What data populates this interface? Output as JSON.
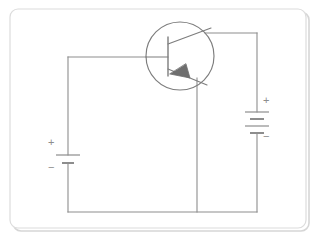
{
  "figure": {
    "kind": "electronic-circuit-schematic",
    "background_color": "#ffffff",
    "border": {
      "name": "figure-frame",
      "color": "#d8d8d8",
      "shadow_color": "#cfcfcf",
      "corner_radius": 8,
      "x": 10,
      "y": 9,
      "width": 296,
      "height": 219
    },
    "line_color": "#8d8d8d",
    "line_width": 1.1,
    "label_color": "#8d8d8d"
  },
  "components": {
    "transistor": {
      "name": "pnp-transistor",
      "type": "PNP bipolar junction transistor",
      "envelope_circle": {
        "cx": 180,
        "cy": 56,
        "r": 34
      },
      "base_bar": {
        "x": 168,
        "y1": 37,
        "y2": 76
      },
      "base_lead": {
        "x1": 146,
        "y1": 57,
        "x2": 168,
        "y2": 57
      },
      "collector_lead": {
        "x1": 168,
        "y1": 43,
        "x2": 213,
        "y2": 26
      },
      "emitter_lead": {
        "x1": 168,
        "y1": 70,
        "x2": 206,
        "y2": 86
      },
      "arrow_on": "emitter",
      "arrow_direction": "toward-base"
    },
    "battery_left": {
      "name": "battery-left",
      "cells": 1,
      "orientation": "vertical",
      "x": 68,
      "plus_plate_y": 155,
      "minus_plate_y": 163,
      "plus_label": "+",
      "minus_label": "−",
      "plus_label_pos": {
        "x": 49,
        "y": 142
      },
      "minus_label_pos": {
        "x": 49,
        "y": 166
      }
    },
    "battery_right": {
      "name": "battery-right",
      "cells": 2,
      "orientation": "vertical",
      "x": 257,
      "plate_ys": [
        112,
        119,
        126,
        133
      ],
      "plus_label": "+",
      "minus_label": "−",
      "plus_label_pos": {
        "x": 264,
        "y": 99
      },
      "minus_label_pos": {
        "x": 264,
        "y": 135
      }
    }
  },
  "wires": {
    "base_branch_top": {
      "name": "wire-base-top",
      "x1": 68,
      "y1": 57,
      "x2": 146,
      "y2": 57
    },
    "left_vertical_upper": {
      "name": "wire-left-upper",
      "x1": 68,
      "y1": 57,
      "x2": 68,
      "y2": 155
    },
    "left_vertical_lower": {
      "name": "wire-left-lower",
      "x1": 68,
      "y1": 163,
      "x2": 68,
      "y2": 212
    },
    "bottom_horizontal": {
      "name": "wire-bottom",
      "x1": 68,
      "y1": 212,
      "x2": 257,
      "y2": 212
    },
    "emitter_vertical": {
      "name": "wire-emitter-down",
      "x1": 197,
      "y1": 78,
      "x2": 197,
      "y2": 212
    },
    "collector_top": {
      "name": "wire-collector-top",
      "x1": 206,
      "y1": 33,
      "x2": 257,
      "y2": 33
    },
    "right_vertical_upper": {
      "name": "wire-right-upper",
      "x1": 257,
      "y1": 33,
      "x2": 257,
      "y2": 112
    },
    "right_vertical_lower": {
      "name": "wire-right-lower",
      "x1": 257,
      "y1": 133,
      "x2": 257,
      "y2": 212
    }
  },
  "labels": {
    "battery_left_plus": "+",
    "battery_left_minus": "−",
    "battery_right_plus": "+",
    "battery_right_minus": "−"
  }
}
